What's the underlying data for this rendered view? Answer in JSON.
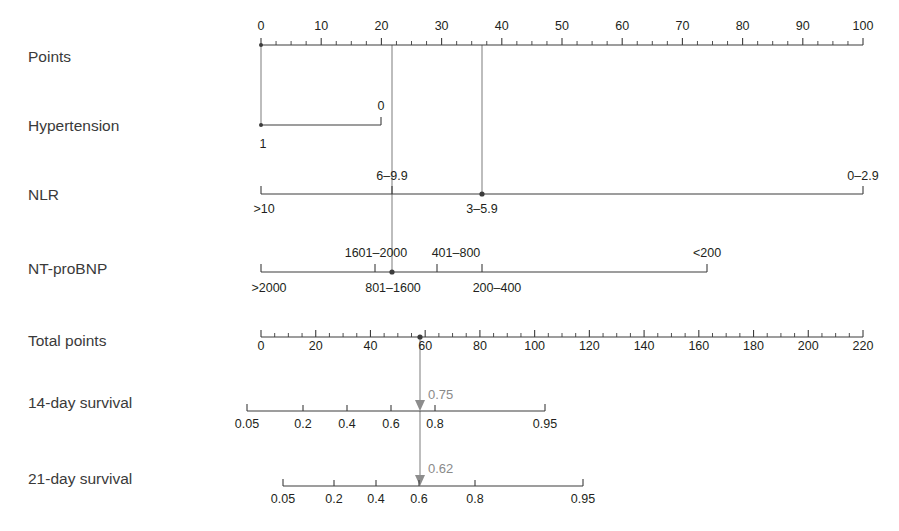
{
  "figure": {
    "type": "nomogram",
    "background": "#ffffff",
    "line_color": "#3c3c3c",
    "connector_color": "#8d8d8d",
    "value_label_color": "#8a8a8a"
  },
  "rows": [
    {
      "id": "points",
      "label": "Points",
      "kind": "scale",
      "axis": {
        "min": 0,
        "max": 100,
        "x_start": 261,
        "x_end": 863,
        "y": 45
      },
      "major_ticks": [
        0,
        10,
        20,
        30,
        40,
        50,
        60,
        70,
        80,
        90,
        100
      ],
      "major_tick_labels": [
        "0",
        "10",
        "20",
        "30",
        "40",
        "50",
        "60",
        "70",
        "80",
        "90",
        "100"
      ],
      "minor_tick_step": 2.5,
      "label_side": "above"
    },
    {
      "id": "hypertension",
      "label": "Hypertension",
      "kind": "categorical",
      "axis": {
        "x_start": 261,
        "x_end": 381,
        "y": 125
      },
      "points": [
        {
          "value": "1",
          "points": 0,
          "x": 261,
          "side": "below"
        },
        {
          "value": "0",
          "points": 20,
          "x": 381,
          "side": "above"
        }
      ]
    },
    {
      "id": "nlr",
      "label": "NLR",
      "kind": "categorical",
      "axis": {
        "x_start": 261,
        "x_end": 863,
        "y": 194
      },
      "points": [
        {
          "value": ">10",
          "points": 0,
          "x": 261,
          "side": "below"
        },
        {
          "value": "6–9.9",
          "points": 21.5,
          "x": 392,
          "side": "above"
        },
        {
          "value": "3–5.9",
          "points": 36.5,
          "x": 482,
          "side": "below"
        },
        {
          "value": "0–2.9",
          "points": 100,
          "x": 863,
          "side": "above"
        }
      ]
    },
    {
      "id": "ntprobnp",
      "label": "NT-proBNP",
      "kind": "categorical",
      "axis": {
        "x_start": 261,
        "x_end": 707,
        "y": 272
      },
      "points": [
        {
          "value": ">2000",
          "points": 0,
          "x": 261,
          "side": "below"
        },
        {
          "value": "1601–2000",
          "points": 19,
          "x": 375,
          "side": "above"
        },
        {
          "value": "801–1600",
          "points": 22,
          "x": 392,
          "side": "below"
        },
        {
          "value": "401–800",
          "points": 29,
          "x": 437,
          "side": "above"
        },
        {
          "value": "200–400",
          "points": 36.5,
          "x": 482,
          "side": "below"
        },
        {
          "value": "<200",
          "points": 74,
          "x": 707,
          "side": "above"
        }
      ]
    },
    {
      "id": "total-points",
      "label": "Total points",
      "kind": "scale",
      "axis": {
        "min": 0,
        "max": 220,
        "x_start": 261,
        "x_end": 863,
        "y": 337
      },
      "major_ticks": [
        0,
        20,
        40,
        60,
        80,
        100,
        120,
        140,
        160,
        180,
        200,
        220
      ],
      "major_tick_labels": [
        "0",
        "20",
        "40",
        "60",
        "80",
        "100",
        "120",
        "140",
        "160",
        "180",
        "200",
        "220"
      ],
      "minor_tick_step": 5,
      "label_side": "below"
    },
    {
      "id": "survival-14",
      "label": "14-day survival",
      "kind": "probability",
      "axis": {
        "x_start": 247,
        "x_end": 545,
        "y": 411
      },
      "ticks": [
        {
          "value": "0.05",
          "x": 247
        },
        {
          "value": "0.2",
          "x": 303
        },
        {
          "value": "0.4",
          "x": 347
        },
        {
          "value": "0.6",
          "x": 391
        },
        {
          "value": "0.8",
          "x": 435
        },
        {
          "value": "0.95",
          "x": 545
        }
      ],
      "label_side": "below"
    },
    {
      "id": "survival-21",
      "label": "21-day survival",
      "kind": "probability",
      "axis": {
        "x_start": 283,
        "x_end": 583,
        "y": 486
      },
      "ticks": [
        {
          "value": "0.05",
          "x": 283
        },
        {
          "value": "0.2",
          "x": 334
        },
        {
          "value": "0.4",
          "x": 376
        },
        {
          "value": "0.6",
          "x": 419
        },
        {
          "value": "0.8",
          "x": 475
        },
        {
          "value": "0.95",
          "x": 583
        }
      ],
      "label_side": "below"
    }
  ],
  "reading_lines": [
    {
      "id": "line-hypertension-nlr-bnp",
      "x": 392,
      "y_start": 45,
      "y_end": 272,
      "points_value": 22,
      "color": "#8d8d8d"
    },
    {
      "id": "line-nlr",
      "x": 482,
      "y_start": 45,
      "y_end": 194,
      "points_value": 36.5,
      "color": "#8d8d8d"
    },
    {
      "id": "line-total-to-survival",
      "x": 420,
      "y_start": 337,
      "y_end": 486,
      "total_points_value": 58,
      "color": "#8d8d8d"
    }
  ],
  "markers": [
    {
      "id": "marker-nlr",
      "x": 482,
      "y": 194,
      "row": "nlr"
    },
    {
      "id": "marker-ntprobnp",
      "x": 392,
      "y": 272,
      "row": "ntprobnp"
    },
    {
      "id": "marker-total-points",
      "x": 420,
      "y": 337,
      "row": "total-points"
    }
  ],
  "readouts": [
    {
      "id": "readout-14day",
      "label": "0.75",
      "x": 428,
      "y": 401,
      "row": "survival-14"
    },
    {
      "id": "readout-21day",
      "label": "0.62",
      "x": 428,
      "y": 474,
      "row": "survival-21"
    }
  ],
  "chart_data": {
    "type": "nomogram",
    "title": "",
    "scales": {
      "points": {
        "min": 0,
        "max": 100,
        "ticks": [
          0,
          10,
          20,
          30,
          40,
          50,
          60,
          70,
          80,
          90,
          100
        ]
      },
      "total_points": {
        "min": 0,
        "max": 220,
        "ticks": [
          0,
          20,
          40,
          60,
          80,
          100,
          120,
          140,
          160,
          180,
          200,
          220
        ]
      },
      "survival_14day": {
        "ticks": [
          0.05,
          0.2,
          0.4,
          0.6,
          0.8,
          0.95
        ]
      },
      "survival_21day": {
        "ticks": [
          0.05,
          0.2,
          0.4,
          0.6,
          0.8,
          0.95
        ]
      }
    },
    "predictors": [
      {
        "name": "Hypertension",
        "levels": [
          "1",
          "0"
        ],
        "points": [
          0,
          20
        ]
      },
      {
        "name": "NLR",
        "levels": [
          ">10",
          "6–9.9",
          "3–5.9",
          "0–2.9"
        ],
        "points": [
          0,
          21.5,
          36.5,
          100
        ]
      },
      {
        "name": "NT-proBNP",
        "levels": [
          ">2000",
          "1601–2000",
          "801–1600",
          "401–800",
          "200–400",
          "<200"
        ],
        "points": [
          0,
          19,
          22,
          29,
          36.5,
          74
        ]
      }
    ],
    "example_reading": {
      "selected_points": [
        22,
        36.5,
        22
      ],
      "total_points": 58,
      "survival_14day": 0.75,
      "survival_21day": 0.62
    }
  }
}
